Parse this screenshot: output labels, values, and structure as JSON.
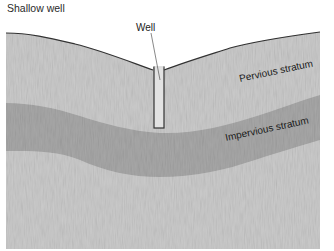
{
  "title": "Shallow well",
  "labels": {
    "well": "Well",
    "pervious": "Pervious stratum",
    "impervious": "Impervious stratum"
  },
  "colors": {
    "pervious_fill": "#cbcbcb",
    "impervious_fill": "#a8a8a8",
    "well_fill": "#e2e2e2",
    "outline": "#333333"
  }
}
